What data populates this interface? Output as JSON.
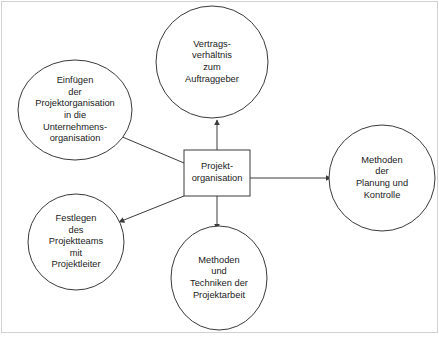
{
  "diagram": {
    "title": "Projektorganisation",
    "frame": {
      "stroke": "#c8c8c8",
      "visible": true
    },
    "style": {
      "node_stroke": "#3a3a3a",
      "node_fill": "#ffffff",
      "connector_stroke": "#3a3a3a",
      "text_color": "#1a1a1a"
    },
    "center": {
      "id": "projektorganisation",
      "shape": "rectangle",
      "label": "Projekt-\norganisation",
      "x": 184,
      "y": 150,
      "width": 66,
      "height": 46
    },
    "nodes": [
      {
        "id": "vertragsverhaeltnis",
        "shape": "ellipse",
        "label": "Vertrags-\nverhältnis\nzum\nAuftraggeber",
        "cx": 212,
        "cy": 62,
        "rx": 56,
        "ry": 56,
        "position": "top"
      },
      {
        "id": "einfuegen",
        "shape": "ellipse",
        "label": "Einfügen\nder\nProjektorganisation\nin die\nUnternehmens-\norganisation",
        "cx": 75,
        "cy": 110,
        "rx": 57,
        "ry": 50,
        "position": "top-left"
      },
      {
        "id": "festlegen",
        "shape": "ellipse",
        "label": "Festlegen\ndes\nProjektteams\nmit\nProjektleiter",
        "cx": 76,
        "cy": 242,
        "rx": 48,
        "ry": 48,
        "position": "bottom-left"
      },
      {
        "id": "methoden-techniken",
        "shape": "ellipse",
        "label": "Methoden\nund\nTechniken der\nProjektarbeit",
        "cx": 219,
        "cy": 278,
        "rx": 48,
        "ry": 52,
        "position": "bottom"
      },
      {
        "id": "methoden-planung",
        "shape": "ellipse",
        "label": "Methoden\nder\nPlanung und\nKontrolle",
        "cx": 382,
        "cy": 178,
        "rx": 53,
        "ry": 53,
        "position": "right"
      }
    ],
    "connectors": [
      {
        "id": "center-to-vertragsverhaeltnis",
        "from": "projektorganisation",
        "to": "vertragsverhaeltnis",
        "direction": "up",
        "arrowhead": "target"
      },
      {
        "id": "center-to-einfuegen",
        "from": "projektorganisation",
        "to": "einfuegen",
        "direction": "up-left",
        "arrowhead": "target"
      },
      {
        "id": "center-to-festlegen",
        "from": "projektorganisation",
        "to": "festlegen",
        "direction": "down-left",
        "arrowhead": "target"
      },
      {
        "id": "center-to-methoden-techniken",
        "from": "projektorganisation",
        "to": "methoden-techniken",
        "direction": "down",
        "arrowhead": "target"
      },
      {
        "id": "center-to-methoden-planung",
        "from": "projektorganisation",
        "to": "methoden-planung",
        "direction": "right",
        "arrowhead": "target"
      }
    ]
  }
}
